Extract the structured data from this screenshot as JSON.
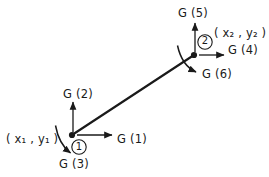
{
  "figure": {
    "type": "beam-element-dof-diagram",
    "background_color": "#ffffff",
    "ink_color": "#1a1a1a"
  },
  "nodes": [
    {
      "id": "node-1",
      "number": "1",
      "coordinate_label": "( x₁ , y₁ )",
      "coordinate_text": "( x1 , y1 )",
      "x": 72,
      "y": 135,
      "circle_center_x": 79,
      "circle_center_y": 147,
      "circle_radius": 7
    },
    {
      "id": "node-2",
      "number": "2",
      "coordinate_label": "( x₂ , y₂ )",
      "coordinate_text": "( x2 , y2 )",
      "x": 194,
      "y": 55,
      "circle_center_x": 205,
      "circle_center_y": 42,
      "circle_radius": 7
    }
  ],
  "member": {
    "name": "beam-element",
    "from_x": 72,
    "from_y": 135,
    "to_x": 194,
    "to_y": 55
  },
  "degrees_of_freedom": [
    {
      "id": "g1",
      "label": "G (1)",
      "node": "node-1",
      "kind": "translation",
      "direction": "horizontal-right",
      "arrow_from_x": 76,
      "arrow_from_y": 135,
      "arrow_to_x": 113,
      "arrow_to_y": 135
    },
    {
      "id": "g2",
      "label": "G (2)",
      "node": "node-1",
      "kind": "translation",
      "direction": "vertical-up",
      "arrow_from_x": 73,
      "arrow_from_y": 133,
      "arrow_to_x": 73,
      "arrow_to_y": 101
    },
    {
      "id": "g3",
      "label": "G (3)",
      "node": "node-1",
      "kind": "rotation",
      "direction": "clockwise",
      "arc_start_x": 56,
      "arc_start_y": 126,
      "arc_end_x": 71,
      "arc_end_y": 154
    },
    {
      "id": "g4",
      "label": "G (4)",
      "node": "node-2",
      "kind": "translation",
      "direction": "horizontal-right",
      "arrow_from_x": 198,
      "arrow_from_y": 55,
      "arrow_to_x": 225,
      "arrow_to_y": 55
    },
    {
      "id": "g5",
      "label": "G (5)",
      "node": "node-2",
      "kind": "translation",
      "direction": "vertical-up",
      "arrow_from_x": 195,
      "arrow_from_y": 53,
      "arrow_to_x": 195,
      "arrow_to_y": 22
    },
    {
      "id": "g6",
      "label": "G (6)",
      "node": "node-2",
      "kind": "rotation",
      "direction": "clockwise",
      "arc_start_x": 178,
      "arc_start_y": 46,
      "arc_end_x": 197,
      "arc_end_y": 73
    }
  ]
}
